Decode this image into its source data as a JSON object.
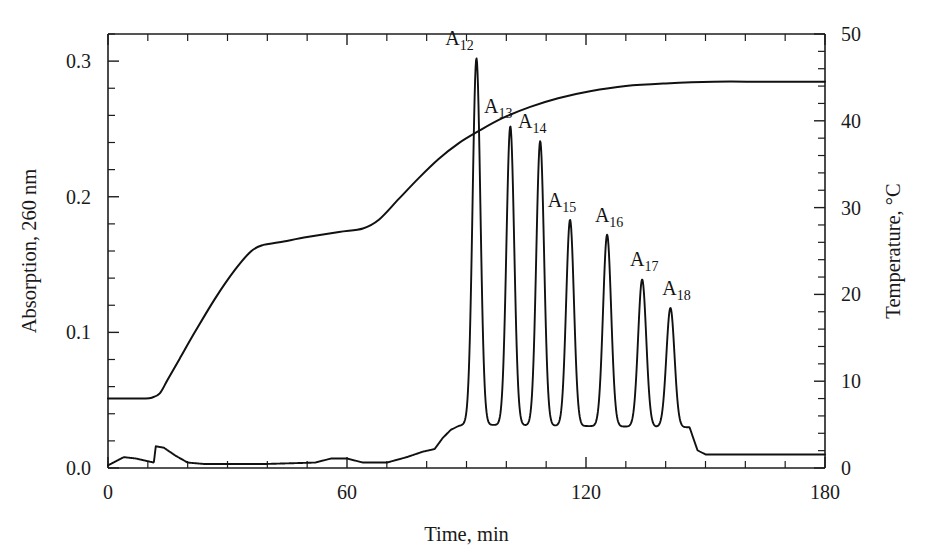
{
  "chart_data": {
    "type": "line",
    "title": "",
    "subtitle": "",
    "xlabel": "Time, min",
    "ylabel": "Absorption, 260 nm",
    "y2label": "Temperature, °C",
    "xlim": [
      0,
      180
    ],
    "ylim": [
      0.0,
      0.32
    ],
    "y2lim": [
      0,
      50
    ],
    "grid": false,
    "legend": null,
    "x_ticks": [
      0,
      60,
      120,
      180
    ],
    "x_tick_labels": [
      "0",
      "60",
      "120",
      "180"
    ],
    "x_minor_tick_step": 10,
    "y_ticks": [
      0.0,
      0.1,
      0.2,
      0.3
    ],
    "y_tick_labels": [
      "0.0",
      "0.1",
      "0.2",
      "0.3"
    ],
    "y_minor_tick_step": 0.02,
    "y2_ticks": [
      0,
      10,
      20,
      30,
      40,
      50
    ],
    "y2_tick_labels": [
      "0",
      "10",
      "20",
      "30",
      "40",
      "50"
    ],
    "y2_minor_tick_step": 2,
    "series": [
      {
        "name": "Absorption chromatogram",
        "axis": "left",
        "unit": "absorbance at 260 nm",
        "baseline": 0.005,
        "peaks": [
          {
            "label": "A12",
            "label_text": "A",
            "label_sub": "12",
            "retention_time_min": 92.5,
            "height_absorption": 0.302,
            "width_min": 2.3
          },
          {
            "label": "A13",
            "label_text": "A",
            "label_sub": "13",
            "retention_time_min": 101.0,
            "height_absorption": 0.252,
            "width_min": 2.3
          },
          {
            "label": "A14",
            "label_text": "A",
            "label_sub": "14",
            "retention_time_min": 108.5,
            "height_absorption": 0.241,
            "width_min": 2.3
          },
          {
            "label": "A15",
            "label_text": "A",
            "label_sub": "15",
            "retention_time_min": 116.0,
            "height_absorption": 0.183,
            "width_min": 2.3
          },
          {
            "label": "A16",
            "label_text": "A",
            "label_sub": "16",
            "retention_time_min": 125.3,
            "height_absorption": 0.172,
            "width_min": 2.4
          },
          {
            "label": "A17",
            "label_text": "A",
            "label_sub": "17",
            "retention_time_min": 134.1,
            "height_absorption": 0.139,
            "width_min": 2.4
          },
          {
            "label": "A18",
            "label_text": "A",
            "label_sub": "18",
            "retention_time_min": 141.2,
            "height_absorption": 0.118,
            "width_min": 2.4
          }
        ],
        "baseline_points": [
          {
            "x": 0,
            "y": 0.002
          },
          {
            "x": 2,
            "y": 0.005
          },
          {
            "x": 4,
            "y": 0.008
          },
          {
            "x": 7,
            "y": 0.007
          },
          {
            "x": 10,
            "y": 0.005
          },
          {
            "x": 11.5,
            "y": 0.004
          },
          {
            "x": 12,
            "y": 0.016
          },
          {
            "x": 14,
            "y": 0.015
          },
          {
            "x": 17,
            "y": 0.009
          },
          {
            "x": 20,
            "y": 0.004
          },
          {
            "x": 24,
            "y": 0.003
          },
          {
            "x": 40,
            "y": 0.003
          },
          {
            "x": 52,
            "y": 0.004
          },
          {
            "x": 56,
            "y": 0.007
          },
          {
            "x": 60,
            "y": 0.007
          },
          {
            "x": 64,
            "y": 0.004
          },
          {
            "x": 70,
            "y": 0.004
          },
          {
            "x": 75,
            "y": 0.008
          },
          {
            "x": 79,
            "y": 0.012
          },
          {
            "x": 82,
            "y": 0.014
          },
          {
            "x": 84,
            "y": 0.022
          },
          {
            "x": 86,
            "y": 0.028
          },
          {
            "x": 88,
            "y": 0.031
          },
          {
            "x": 89.5,
            "y": 0.032
          },
          {
            "x": 146,
            "y": 0.03
          },
          {
            "x": 148,
            "y": 0.013
          },
          {
            "x": 150,
            "y": 0.01
          },
          {
            "x": 160,
            "y": 0.01
          },
          {
            "x": 180,
            "y": 0.01
          }
        ]
      },
      {
        "name": "Temperature gradient",
        "axis": "right",
        "unit": "°C",
        "points": [
          {
            "x": 0,
            "y": 8.0
          },
          {
            "x": 5,
            "y": 8.0
          },
          {
            "x": 9,
            "y": 8.0
          },
          {
            "x": 11,
            "y": 8.1
          },
          {
            "x": 13,
            "y": 8.6
          },
          {
            "x": 15,
            "y": 10.2
          },
          {
            "x": 18,
            "y": 12.6
          },
          {
            "x": 22,
            "y": 15.8
          },
          {
            "x": 27,
            "y": 19.6
          },
          {
            "x": 32,
            "y": 22.9
          },
          {
            "x": 36,
            "y": 25.0
          },
          {
            "x": 39,
            "y": 25.7
          },
          {
            "x": 43,
            "y": 26.0
          },
          {
            "x": 50,
            "y": 26.6
          },
          {
            "x": 58,
            "y": 27.2
          },
          {
            "x": 64,
            "y": 27.6
          },
          {
            "x": 68,
            "y": 28.6
          },
          {
            "x": 73,
            "y": 31.0
          },
          {
            "x": 78,
            "y": 33.4
          },
          {
            "x": 83,
            "y": 35.6
          },
          {
            "x": 88,
            "y": 37.4
          },
          {
            "x": 93,
            "y": 38.8
          },
          {
            "x": 99,
            "y": 40.3
          },
          {
            "x": 106,
            "y": 41.6
          },
          {
            "x": 113,
            "y": 42.6
          },
          {
            "x": 121,
            "y": 43.4
          },
          {
            "x": 130,
            "y": 44.0
          },
          {
            "x": 140,
            "y": 44.3
          },
          {
            "x": 152,
            "y": 44.5
          },
          {
            "x": 165,
            "y": 44.5
          },
          {
            "x": 180,
            "y": 44.5
          }
        ]
      }
    ],
    "annotations": [
      {
        "text": "A12",
        "target": "peak 1"
      },
      {
        "text": "A13",
        "target": "peak 2"
      },
      {
        "text": "A14",
        "target": "peak 3"
      },
      {
        "text": "A15",
        "target": "peak 4"
      },
      {
        "text": "A16",
        "target": "peak 5"
      },
      {
        "text": "A17",
        "target": "peak 6"
      },
      {
        "text": "A18",
        "target": "peak 7"
      }
    ],
    "colors": {
      "curve": "#111111",
      "axis": "#1d1d1d",
      "background": "#ffffff"
    }
  }
}
